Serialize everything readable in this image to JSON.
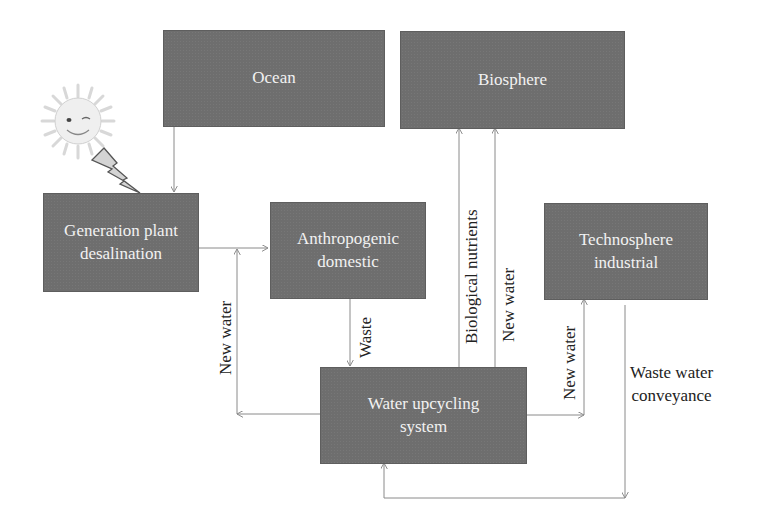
{
  "diagram": {
    "nodes": {
      "ocean": "Ocean",
      "biosphere": "Biosphere",
      "generation": "Generation plant\ndesalination",
      "anthropogenic": "Anthropogenic\ndomestic",
      "technosphere": "Technosphere\nindustrial",
      "upcycling": "Water upcycling\nsystem"
    },
    "edge_labels": {
      "new_water_left": "New water",
      "waste": "Waste",
      "biological_nutrients": "Biological nutrients",
      "new_water_biosphere": "New water",
      "new_water_techno": "New water",
      "waste_water_conveyance": "Waste water\nconveyance"
    },
    "edges": [
      {
        "from": "Ocean",
        "to": "Generation plant desalination"
      },
      {
        "from": "Generation plant desalination",
        "to": "Anthropogenic domestic"
      },
      {
        "from": "Anthropogenic domestic",
        "to": "Water upcycling system",
        "label": "Waste"
      },
      {
        "from": "Water upcycling system",
        "to": "Anthropogenic domestic",
        "label": "New water"
      },
      {
        "from": "Water upcycling system",
        "to": "Biosphere",
        "label": "Biological nutrients"
      },
      {
        "from": "Water upcycling system",
        "to": "Biosphere",
        "label": "New water"
      },
      {
        "from": "Water upcycling system",
        "to": "Technosphere industrial",
        "label": "New water"
      },
      {
        "from": "Technosphere industrial",
        "to": "Water upcycling system",
        "label": "Waste water conveyance"
      }
    ],
    "icons": [
      "sun-icon",
      "lightning-bolt-icon"
    ],
    "colors": {
      "box": "#6e6e6e",
      "box_text": "#f2f2f2",
      "line": "#8a8a8a"
    }
  }
}
